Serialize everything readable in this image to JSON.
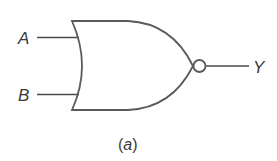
{
  "diagram": {
    "gate_type": "NOR",
    "inputs": [
      {
        "label": "A"
      },
      {
        "label": "B"
      }
    ],
    "output": {
      "label": "Y"
    },
    "caption": {
      "open": "(",
      "letter": "a",
      "close": ")"
    },
    "stroke_color": "#5a5a5a",
    "background": "#ffffff"
  }
}
